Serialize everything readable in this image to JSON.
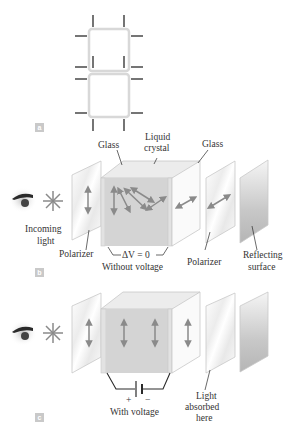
{
  "figure": {
    "panels": [
      {
        "tag": "a",
        "description": "seven-segment display outline"
      },
      {
        "tag": "b",
        "labels": {
          "glass_left": "Glass",
          "liquid_crystal_line1": "Liquid",
          "liquid_crystal_line2": "crystal",
          "glass_right": "Glass",
          "incoming_line1": "Incoming",
          "incoming_line2": "light",
          "polarizer_left": "Polarizer",
          "delta_v": "ΔV = 0",
          "without_voltage": "Without voltage",
          "polarizer_right": "Polarizer",
          "reflecting_line1": "Reflecting",
          "reflecting_line2": "surface"
        }
      },
      {
        "tag": "c",
        "labels": {
          "plus": "+",
          "minus": "−",
          "with_voltage": "With voltage",
          "absorbed_line1": "Light",
          "absorbed_line2": "absorbed",
          "absorbed_line3": "here"
        }
      }
    ],
    "colors": {
      "arrow": "#8a8a8a",
      "segment_border": "#d8d8d8",
      "lead": "#2a2a2a",
      "crystal_face": "#d4d4d4",
      "tag_bg": "#c9c9c9"
    }
  }
}
